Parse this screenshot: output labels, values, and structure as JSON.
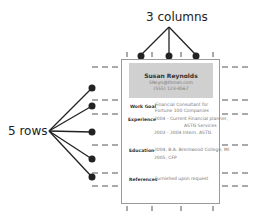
{
  "annotations": {
    "columns_label": "3 columns",
    "rows_label": "5 rows"
  },
  "resume": {
    "name": "Susan Reynolds",
    "email": "SReyn@thmsn.com",
    "phone": "(555) 123-4567",
    "sections": [
      {
        "label": "Work Goal",
        "lines": [
          "Financial Consultant for",
          "Fortune 100 Companies"
        ]
      },
      {
        "label": "Experience",
        "lines": [
          "2004 - Current   Financial planner,",
          "ASTG Services",
          "2003 - 2004   Intern, ASTG"
        ]
      },
      {
        "label": "Education",
        "lines": [
          "2004, B.A. Brentwood College, MI",
          "2005, CFP"
        ]
      },
      {
        "label": "References",
        "lines": [
          "Furnished upon request"
        ]
      }
    ]
  },
  "colors": {
    "line": "#222222",
    "dash": "#555555",
    "header_fill": "#d0d0d0",
    "page_border": "#9a9a9a"
  }
}
